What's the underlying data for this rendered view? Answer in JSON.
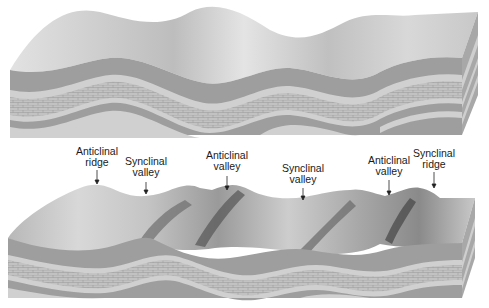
{
  "figure": {
    "top_block": {
      "description": "Folded strata block before erosion"
    },
    "bottom_block": {
      "description": "Folded strata block after erosion"
    },
    "labels": [
      {
        "id": "anticlinal-ridge",
        "text": "Anticlinal\nridge",
        "x": 97,
        "y": 146
      },
      {
        "id": "synclinal-valley-1",
        "text": "Synclinal\nvalley",
        "x": 146,
        "y": 156
      },
      {
        "id": "anticlinal-valley-1",
        "text": "Anticlinal\nvalley",
        "x": 227,
        "y": 150
      },
      {
        "id": "synclinal-valley-2",
        "text": "Synclinal\nvalley",
        "x": 303,
        "y": 163
      },
      {
        "id": "anticlinal-valley-2",
        "text": "Anticlinal\nvalley",
        "x": 389,
        "y": 155
      },
      {
        "id": "synclinal-ridge",
        "text": "Synclinal\nridge",
        "x": 434,
        "y": 148
      }
    ],
    "colors": {
      "surface": "#d4d4d4",
      "dark_layer": "#9c9c9c",
      "light_layer": "#cfcfcf",
      "limestone": "#b9b9b9",
      "side": "#a8a8a8"
    }
  }
}
